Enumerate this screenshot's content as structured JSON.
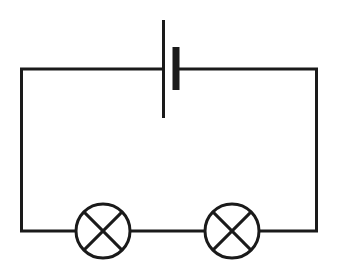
{
  "diagram": {
    "type": "electrical-circuit-schematic",
    "canvas": {
      "width": 341,
      "height": 277,
      "background_color": "#ffffff"
    },
    "style": {
      "line_color": "#1a1a1a",
      "line_width": 3,
      "fill": "none"
    },
    "loop": {
      "label": "circuit-loop-wire",
      "left_x": 20,
      "right_x": 318,
      "top_y": 69,
      "bottom_y": 231
    },
    "components": [
      {
        "id": "battery",
        "label": "Battery (cell)",
        "symbol": "two-parallel-plates",
        "center_x": 169,
        "wire_y": 69,
        "long_plate": {
          "label": "positive-terminal-long-thin-plate",
          "x": 162,
          "y_top": 20,
          "y_bottom": 118,
          "thickness": 3
        },
        "short_plate": {
          "label": "negative-terminal-short-thick-plate",
          "x": 176,
          "y_top": 47,
          "y_bottom": 90,
          "thickness": 7
        },
        "wire_left_end_x": 162,
        "wire_right_start_x": 176
      },
      {
        "id": "lamp-1",
        "label": "Lamp 1",
        "symbol": "circle-with-cross",
        "center_x": 103,
        "center_y": 231,
        "radius": 27
      },
      {
        "id": "lamp-2",
        "label": "Lamp 2",
        "symbol": "circle-with-cross",
        "center_x": 232,
        "center_y": 231,
        "radius": 27
      }
    ],
    "wire_segments": [
      {
        "id": "top-left-wire",
        "x1": 20,
        "y1": 69,
        "x2": 162,
        "y2": 69
      },
      {
        "id": "top-right-wire",
        "x1": 176,
        "y1": 69,
        "x2": 318,
        "y2": 69
      },
      {
        "id": "left-wire",
        "x1": 20,
        "y1": 69,
        "x2": 20,
        "y2": 231
      },
      {
        "id": "right-wire",
        "x1": 318,
        "y1": 69,
        "x2": 318,
        "y2": 231
      },
      {
        "id": "bottom-left-wire",
        "x1": 20,
        "y1": 231,
        "x2": 76,
        "y2": 231
      },
      {
        "id": "bottom-mid-wire",
        "x1": 130,
        "y1": 231,
        "x2": 205,
        "y2": 231
      },
      {
        "id": "bottom-right-wire",
        "x1": 259,
        "y1": 231,
        "x2": 318,
        "y2": 231
      }
    ]
  }
}
